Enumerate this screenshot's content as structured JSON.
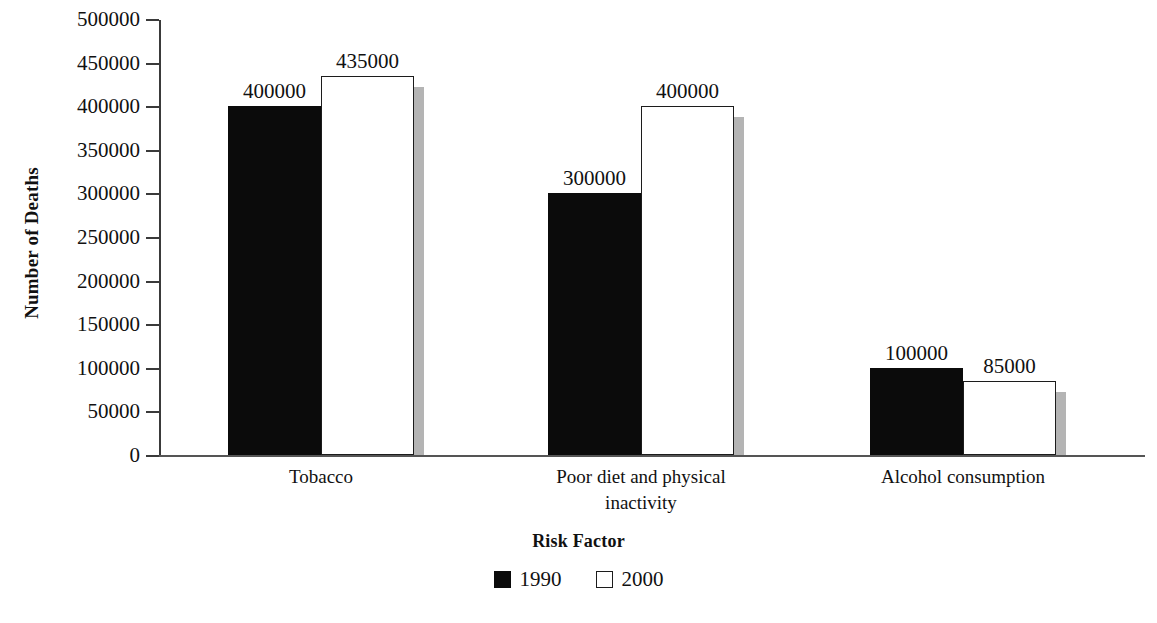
{
  "chart_data": {
    "type": "bar",
    "title": "",
    "xlabel": "Risk Factor",
    "ylabel": "Number of Deaths",
    "categories": [
      "Tobacco",
      "Poor diet and physical\ninactivity",
      "Alcohol consumption"
    ],
    "series": [
      {
        "name": "1990",
        "values": [
          400000,
          300000,
          100000
        ],
        "color": "#0b0b0b",
        "style": "filled"
      },
      {
        "name": "2000",
        "values": [
          435000,
          400000,
          85000
        ],
        "color": "#ffffff",
        "style": "hollow"
      }
    ],
    "value_labels": [
      [
        "400000",
        "300000",
        "100000"
      ],
      [
        "435000",
        "400000",
        "85000"
      ]
    ],
    "ylim": [
      0,
      500000
    ],
    "ytick_values": [
      0,
      50000,
      100000,
      150000,
      200000,
      250000,
      300000,
      350000,
      400000,
      450000,
      500000
    ],
    "ytick_labels": [
      "0",
      "50000",
      "100000",
      "150000",
      "200000",
      "250000",
      "300000",
      "350000",
      "400000",
      "450000",
      "500000"
    ],
    "grid": false,
    "legend_position": "bottom-center",
    "legend_entries": [
      "1990",
      "2000"
    ]
  },
  "axes": {
    "y_title": "Number of Deaths",
    "x_title": "Risk Factor"
  },
  "legend": {
    "items": [
      {
        "label": "1990",
        "style": "filled"
      },
      {
        "label": "2000",
        "style": "hollow"
      }
    ]
  },
  "groups": [
    {
      "label": "Tobacco",
      "label_line1": "Tobacco",
      "label_line2": "",
      "bars": [
        {
          "series": "1990",
          "value_label": "400000"
        },
        {
          "series": "2000",
          "value_label": "435000"
        }
      ]
    },
    {
      "label": "Poor diet and physical inactivity",
      "label_line1": "Poor diet and physical",
      "label_line2": "inactivity",
      "bars": [
        {
          "series": "1990",
          "value_label": "300000"
        },
        {
          "series": "2000",
          "value_label": "400000"
        }
      ]
    },
    {
      "label": "Alcohol consumption",
      "label_line1": "Alcohol consumption",
      "label_line2": "",
      "bars": [
        {
          "series": "1990",
          "value_label": "100000"
        },
        {
          "series": "2000",
          "value_label": "85000"
        }
      ]
    }
  ]
}
